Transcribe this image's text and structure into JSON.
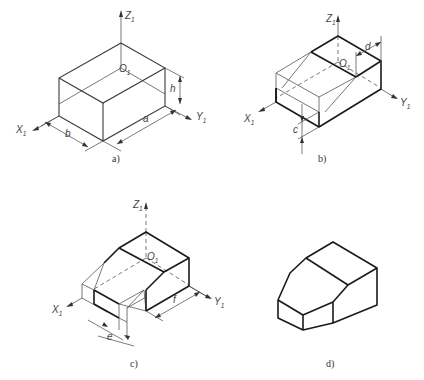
{
  "figures": [
    {
      "id": "a",
      "caption": "a)",
      "axes": {
        "z": "Z",
        "y": "Y",
        "x": "X",
        "subscript": "1",
        "origin": "O"
      },
      "dimensions": [
        "b",
        "a",
        "h"
      ],
      "description": "Rectangular box with dimensions a, b, h on isometric axes"
    },
    {
      "id": "b",
      "caption": "b)",
      "axes": {
        "z": "Z",
        "y": "Y",
        "x": "X",
        "subscript": "1",
        "origin": "O"
      },
      "dimensions": [
        "d",
        "c"
      ],
      "description": "Box with slanted cut construction lines"
    },
    {
      "id": "c",
      "caption": "c)",
      "axes": {
        "z": "Z",
        "y": "Y",
        "x": "X",
        "subscript": "1",
        "origin": "O"
      },
      "dimensions": [
        "e",
        "f"
      ],
      "description": "Box with chamfer cuts construction"
    },
    {
      "id": "d",
      "caption": "d)",
      "description": "Finished isometric solid"
    }
  ]
}
